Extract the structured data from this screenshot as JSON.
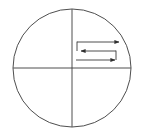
{
  "figure": {
    "background_color": "#ffffff",
    "stroke_color": "#3a3a3a",
    "canvas": {
      "width": 142,
      "height": 135
    }
  },
  "chart_data": {
    "type": "diagram",
    "title": "",
    "xlabel": "",
    "ylabel": "",
    "elements": [
      {
        "name": "boundary-circle",
        "shape": "circle",
        "center_x": 72,
        "center_y": 68,
        "radius": 59,
        "fill": "none",
        "stroke": "#3a3a3a",
        "stroke_width": 0.9
      },
      {
        "name": "vertical-axis",
        "shape": "line",
        "x1": 72,
        "y1": 9,
        "x2": 72,
        "y2": 127,
        "stroke": "#3a3a3a",
        "stroke_width": 0.9
      },
      {
        "name": "horizontal-axis",
        "shape": "line",
        "x1": 13,
        "y1": 68,
        "x2": 131,
        "y2": 68,
        "stroke": "#3a3a3a",
        "stroke_width": 0.9
      },
      {
        "name": "scan-path-segment-top",
        "shape": "line",
        "direction": "right",
        "arrowhead": "end",
        "x1": 77,
        "y1": 42,
        "x2": 122,
        "y2": 42,
        "stroke": "#3a3a3a",
        "stroke_width": 0.9
      },
      {
        "name": "scan-path-riser-left",
        "shape": "line",
        "x1": 77,
        "y1": 42,
        "x2": 77,
        "y2": 51,
        "stroke": "#3a3a3a",
        "stroke_width": 0.9
      },
      {
        "name": "scan-path-segment-middle",
        "shape": "line",
        "direction": "left",
        "arrowhead": "end",
        "x1": 116,
        "y1": 51,
        "x2": 78,
        "y2": 51,
        "stroke": "#3a3a3a",
        "stroke_width": 0.9
      },
      {
        "name": "scan-path-riser-right",
        "shape": "line",
        "x1": 116,
        "y1": 51,
        "x2": 116,
        "y2": 60,
        "stroke": "#3a3a3a",
        "stroke_width": 0.9
      },
      {
        "name": "scan-path-segment-bottom",
        "shape": "line",
        "direction": "right",
        "arrowhead": "end",
        "x1": 76,
        "y1": 60,
        "x2": 118,
        "y2": 60,
        "stroke": "#3a3a3a",
        "stroke_width": 0.9
      }
    ],
    "arrow_count": 3,
    "arrow_directions": [
      "right",
      "left",
      "right"
    ],
    "legend": [],
    "annotations": []
  }
}
